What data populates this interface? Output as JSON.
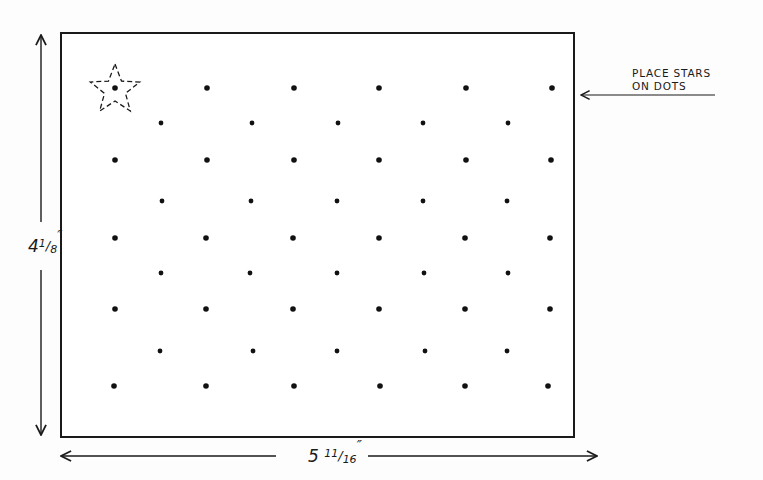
{
  "diagram": {
    "type": "template-dimension-drawing",
    "board": {
      "x": 61,
      "y": 33,
      "width": 513,
      "height": 404,
      "stroke_color": "#1a1a1a"
    },
    "dimensions": {
      "height_label": "4⅛\"",
      "height_label_parts": {
        "whole": "4",
        "frac": "1/8",
        "unit": "″"
      },
      "width_label": "5 ¹¹⁄₁₆\"",
      "width_label_parts": {
        "whole": "5",
        "frac": "11/16",
        "unit": "″"
      }
    },
    "callout": {
      "line1": "PLACE STARS",
      "line2": "ON DOTS"
    },
    "star_marker": {
      "on_dot": "row1-col1",
      "style": "dashed-outline"
    },
    "dot_grid": {
      "rows": [
        {
          "y": 88,
          "xs": [
            115,
            207,
            294,
            379,
            466,
            552
          ]
        },
        {
          "y": 123,
          "xs": [
            161,
            252,
            338,
            423,
            508
          ]
        },
        {
          "y": 160,
          "xs": [
            115,
            207,
            294,
            379,
            466,
            551
          ]
        },
        {
          "y": 201,
          "xs": [
            162,
            251,
            337,
            423,
            507
          ]
        },
        {
          "y": 238,
          "xs": [
            115,
            206,
            293,
            379,
            465,
            550
          ]
        },
        {
          "y": 273,
          "xs": [
            161,
            250,
            337,
            424,
            508
          ]
        },
        {
          "y": 309,
          "xs": [
            115,
            206,
            293,
            379,
            465,
            550
          ]
        },
        {
          "y": 351,
          "xs": [
            160,
            253,
            337,
            425,
            507
          ]
        },
        {
          "y": 386,
          "xs": [
            114,
            206,
            294,
            380,
            465,
            548
          ]
        }
      ],
      "total_dots": 49
    }
  }
}
